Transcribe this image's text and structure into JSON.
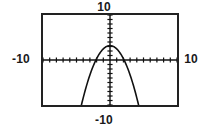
{
  "window": {
    "background_color": "#ffffff",
    "frame_color": "#222222",
    "curve_color": "#111111",
    "axis_color": "#111111"
  },
  "labels": {
    "top": "10",
    "bottom": "-10",
    "left": "-10",
    "right": "10"
  },
  "chart_data": {
    "type": "line",
    "title": "",
    "xlabel": "",
    "ylabel": "",
    "xlim": [
      -10,
      10
    ],
    "ylim": [
      -10,
      10
    ],
    "xtick_labels": [
      "-10",
      "10"
    ],
    "ytick_labels": [
      "-10",
      "10"
    ],
    "grid": false,
    "legend": null,
    "axes": {
      "x_axis_y": 0,
      "y_axis_x": 0,
      "tick_spacing_x": 1,
      "tick_spacing_y": 1,
      "tick_count_x": 20,
      "tick_count_y": 20
    },
    "series": [
      {
        "name": "parabola",
        "shape": "downward-opening parabola",
        "vertex": [
          0,
          3.2
        ],
        "roots": [
          -2.1,
          2.1
        ],
        "x": [
          -3.5,
          -3.0,
          -2.5,
          -2.1,
          -1.5,
          -1.0,
          -0.5,
          0.0,
          0.5,
          1.0,
          1.5,
          2.1,
          2.5,
          3.0,
          3.5
        ],
        "y": [
          -6.6,
          -3.6,
          -1.3,
          0.0,
          1.7,
          2.4,
          3.0,
          3.2,
          3.0,
          2.4,
          1.7,
          0.0,
          -1.3,
          -3.6,
          -6.6
        ]
      }
    ]
  }
}
